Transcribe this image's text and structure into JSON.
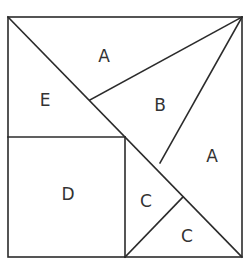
{
  "diagram": {
    "type": "tangram-square-dissection",
    "stroke_color": "#2b2b2b",
    "background": "#ffffff",
    "outer_square": {
      "x1": 8,
      "y1": 17,
      "x2": 242,
      "y2": 257
    },
    "segments": [
      {
        "id": "main-diagonal",
        "x1": 8,
        "y1": 17,
        "x2": 242,
        "y2": 257
      },
      {
        "id": "b-top-edge",
        "x1": 90,
        "y1": 100,
        "x2": 242,
        "y2": 17
      },
      {
        "id": "b-right-edge",
        "x1": 242,
        "y1": 17,
        "x2": 160,
        "y2": 163
      },
      {
        "id": "d-top-edge",
        "x1": 8,
        "y1": 137,
        "x2": 125,
        "y2": 137
      },
      {
        "id": "d-right-edge",
        "x1": 125,
        "y1": 137,
        "x2": 125,
        "y2": 257
      },
      {
        "id": "c-split-edge",
        "x1": 125,
        "y1": 257,
        "x2": 183,
        "y2": 197
      }
    ],
    "pieces": [
      {
        "label": "A",
        "x": 104,
        "y": 57
      },
      {
        "label": "E",
        "x": 45,
        "y": 101
      },
      {
        "label": "B",
        "x": 160,
        "y": 106
      },
      {
        "label": "A",
        "x": 212,
        "y": 157
      },
      {
        "label": "D",
        "x": 68,
        "y": 195
      },
      {
        "label": "C",
        "x": 146,
        "y": 202
      },
      {
        "label": "C",
        "x": 187,
        "y": 237
      }
    ]
  }
}
